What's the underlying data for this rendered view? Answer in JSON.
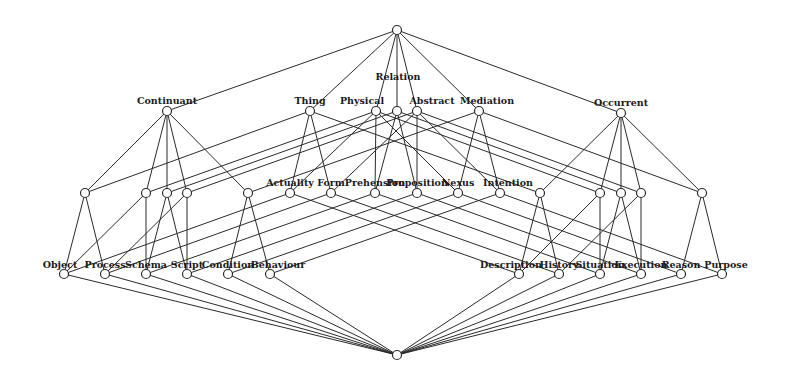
{
  "diagram": {
    "type": "lattice",
    "node_radius": 4.5,
    "colors": {
      "line": "#2a2a2a",
      "node_fill": "#ffffff",
      "text": "#1a1a1a",
      "background": "#ffffff"
    },
    "nodes": [
      {
        "id": "top",
        "label": "",
        "x": 397,
        "y": 30
      },
      {
        "id": "continuant",
        "label": "Continuant",
        "x": 167,
        "y": 111,
        "lx": 167,
        "ly": 104
      },
      {
        "id": "thing",
        "label": "Thing",
        "x": 310,
        "y": 111,
        "lx": 310,
        "ly": 104
      },
      {
        "id": "physical",
        "label": "Physical",
        "x": 376,
        "y": 111,
        "lx": 362,
        "ly": 104
      },
      {
        "id": "relation",
        "label": "Relation",
        "x": 397,
        "y": 111,
        "lx": 398,
        "ly": 80
      },
      {
        "id": "abstract",
        "label": "Abstract",
        "x": 417,
        "y": 111,
        "lx": 432,
        "ly": 104
      },
      {
        "id": "mediation",
        "label": "Mediation",
        "x": 479,
        "y": 111,
        "lx": 487,
        "ly": 104
      },
      {
        "id": "occurrent",
        "label": "Occurrent",
        "x": 621,
        "y": 113,
        "lx": 621,
        "ly": 106
      },
      {
        "id": "l1",
        "label": "",
        "x": 85,
        "y": 193
      },
      {
        "id": "l2",
        "label": "",
        "x": 146,
        "y": 193
      },
      {
        "id": "l3",
        "label": "",
        "x": 167,
        "y": 193
      },
      {
        "id": "l4",
        "label": "",
        "x": 187,
        "y": 193
      },
      {
        "id": "l5",
        "label": "",
        "x": 248,
        "y": 193
      },
      {
        "id": "actuality",
        "label": "Actuality",
        "x": 290,
        "y": 193,
        "lx": 290,
        "ly": 186
      },
      {
        "id": "form",
        "label": "Form",
        "x": 331,
        "y": 193,
        "lx": 331,
        "ly": 186
      },
      {
        "id": "prehension",
        "label": "Prehension",
        "x": 375,
        "y": 193,
        "lx": 375,
        "ly": 186
      },
      {
        "id": "proposition",
        "label": "Proposition",
        "x": 417,
        "y": 193,
        "lx": 417,
        "ly": 186
      },
      {
        "id": "nexus",
        "label": "Nexus",
        "x": 458,
        "y": 193,
        "lx": 458,
        "ly": 186
      },
      {
        "id": "intention",
        "label": "Intention",
        "x": 500,
        "y": 193,
        "lx": 508,
        "ly": 186
      },
      {
        "id": "r1",
        "label": "",
        "x": 540,
        "y": 193
      },
      {
        "id": "r2",
        "label": "",
        "x": 600,
        "y": 193
      },
      {
        "id": "r3",
        "label": "",
        "x": 621,
        "y": 193
      },
      {
        "id": "r4",
        "label": "",
        "x": 641,
        "y": 193
      },
      {
        "id": "r5",
        "label": "",
        "x": 702,
        "y": 193
      },
      {
        "id": "object",
        "label": "Object",
        "x": 64,
        "y": 274,
        "lx": 60,
        "ly": 268
      },
      {
        "id": "process",
        "label": "Process",
        "x": 105,
        "y": 274,
        "lx": 105,
        "ly": 268
      },
      {
        "id": "schema",
        "label": "Schema",
        "x": 146,
        "y": 274,
        "lx": 146,
        "ly": 268
      },
      {
        "id": "script",
        "label": "Script",
        "x": 187,
        "y": 274,
        "lx": 187,
        "ly": 268
      },
      {
        "id": "condition",
        "label": "Condition",
        "x": 228,
        "y": 274,
        "lx": 228,
        "ly": 268
      },
      {
        "id": "behaviour",
        "label": "Behaviour",
        "x": 270,
        "y": 274,
        "lx": 278,
        "ly": 268
      },
      {
        "id": "description",
        "label": "Description",
        "x": 519,
        "y": 274,
        "lx": 511,
        "ly": 268
      },
      {
        "id": "history",
        "label": "History",
        "x": 559,
        "y": 274,
        "lx": 559,
        "ly": 268
      },
      {
        "id": "situation",
        "label": "Situation",
        "x": 600,
        "y": 274,
        "lx": 600,
        "ly": 268
      },
      {
        "id": "execution",
        "label": "Execution",
        "x": 641,
        "y": 274,
        "lx": 641,
        "ly": 268
      },
      {
        "id": "reason",
        "label": "Reason",
        "x": 681,
        "y": 274,
        "lx": 681,
        "ly": 268
      },
      {
        "id": "purpose",
        "label": "Purpose",
        "x": 722,
        "y": 274,
        "lx": 726,
        "ly": 268
      },
      {
        "id": "bottom",
        "label": "",
        "x": 397,
        "y": 355
      }
    ],
    "edges": [
      [
        "top",
        "continuant"
      ],
      [
        "top",
        "thing"
      ],
      [
        "top",
        "physical"
      ],
      [
        "top",
        "relation"
      ],
      [
        "top",
        "abstract"
      ],
      [
        "top",
        "mediation"
      ],
      [
        "top",
        "occurrent"
      ],
      [
        "continuant",
        "l1"
      ],
      [
        "continuant",
        "l2"
      ],
      [
        "continuant",
        "l3"
      ],
      [
        "continuant",
        "l4"
      ],
      [
        "continuant",
        "l5"
      ],
      [
        "occurrent",
        "r1"
      ],
      [
        "occurrent",
        "r2"
      ],
      [
        "occurrent",
        "r3"
      ],
      [
        "occurrent",
        "r4"
      ],
      [
        "occurrent",
        "r5"
      ],
      [
        "thing",
        "l1"
      ],
      [
        "thing",
        "actuality"
      ],
      [
        "thing",
        "form"
      ],
      [
        "thing",
        "r1"
      ],
      [
        "mediation",
        "l5"
      ],
      [
        "mediation",
        "nexus"
      ],
      [
        "mediation",
        "intention"
      ],
      [
        "mediation",
        "r5"
      ],
      [
        "physical",
        "l2"
      ],
      [
        "physical",
        "actuality"
      ],
      [
        "physical",
        "prehension"
      ],
      [
        "physical",
        "nexus"
      ],
      [
        "physical",
        "r2"
      ],
      [
        "abstract",
        "l4"
      ],
      [
        "abstract",
        "form"
      ],
      [
        "abstract",
        "proposition"
      ],
      [
        "abstract",
        "intention"
      ],
      [
        "abstract",
        "r4"
      ],
      [
        "relation",
        "l3"
      ],
      [
        "relation",
        "prehension"
      ],
      [
        "relation",
        "proposition"
      ],
      [
        "relation",
        "r3"
      ],
      [
        "l1",
        "object"
      ],
      [
        "l1",
        "process"
      ],
      [
        "l2",
        "object"
      ],
      [
        "l2",
        "schema"
      ],
      [
        "l3",
        "schema"
      ],
      [
        "l3",
        "script"
      ],
      [
        "l4",
        "process"
      ],
      [
        "l4",
        "script"
      ],
      [
        "l5",
        "condition"
      ],
      [
        "l5",
        "behaviour"
      ],
      [
        "actuality",
        "object"
      ],
      [
        "actuality",
        "description"
      ],
      [
        "form",
        "process"
      ],
      [
        "form",
        "history"
      ],
      [
        "prehension",
        "schema"
      ],
      [
        "prehension",
        "situation"
      ],
      [
        "proposition",
        "script"
      ],
      [
        "proposition",
        "execution"
      ],
      [
        "nexus",
        "condition"
      ],
      [
        "nexus",
        "reason"
      ],
      [
        "intention",
        "behaviour"
      ],
      [
        "intention",
        "purpose"
      ],
      [
        "r1",
        "description"
      ],
      [
        "r1",
        "history"
      ],
      [
        "r2",
        "description"
      ],
      [
        "r2",
        "situation"
      ],
      [
        "r3",
        "situation"
      ],
      [
        "r3",
        "execution"
      ],
      [
        "r4",
        "history"
      ],
      [
        "r4",
        "execution"
      ],
      [
        "r5",
        "reason"
      ],
      [
        "r5",
        "purpose"
      ],
      [
        "object",
        "bottom"
      ],
      [
        "process",
        "bottom"
      ],
      [
        "schema",
        "bottom"
      ],
      [
        "script",
        "bottom"
      ],
      [
        "condition",
        "bottom"
      ],
      [
        "behaviour",
        "bottom"
      ],
      [
        "description",
        "bottom"
      ],
      [
        "history",
        "bottom"
      ],
      [
        "situation",
        "bottom"
      ],
      [
        "execution",
        "bottom"
      ],
      [
        "reason",
        "bottom"
      ],
      [
        "purpose",
        "bottom"
      ]
    ]
  }
}
